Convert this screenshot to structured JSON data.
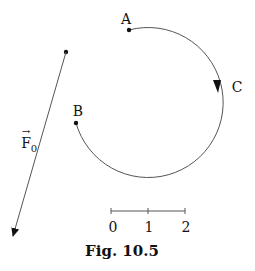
{
  "figure": {
    "caption": "Fig. 10.5",
    "points": {
      "A": {
        "label": "A"
      },
      "B": {
        "label": "B"
      },
      "C": {
        "label": "C"
      }
    },
    "force": {
      "label": "F",
      "subscript": "0",
      "vector_arrow": "→"
    },
    "scale": {
      "ticks": [
        "0",
        "1",
        "2"
      ]
    },
    "colors": {
      "line": "#555555",
      "ink": "#111111",
      "background": "#ffffff"
    }
  }
}
